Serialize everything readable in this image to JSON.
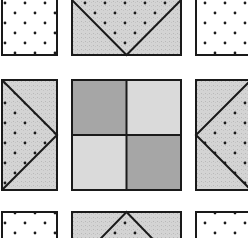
{
  "figure": {
    "colors": {
      "background": "#ffffff",
      "outline": "#1a1a1a",
      "dotted_fabric": "#ffffff",
      "dot": "#1a1a1a",
      "speckled_gray": "#d2d2d2",
      "dark_gray": "#a6a6a6",
      "light_gray": "#dadada"
    },
    "blocks": [
      {
        "id": "corner-top-left",
        "type": "dotted-square"
      },
      {
        "id": "goose-top",
        "type": "flying-geese",
        "point": "down"
      },
      {
        "id": "corner-top-right",
        "type": "dotted-square"
      },
      {
        "id": "goose-left",
        "type": "flying-geese",
        "point": "right"
      },
      {
        "id": "center",
        "type": "four-patch",
        "cells": [
          "dark",
          "light",
          "light",
          "dark"
        ]
      },
      {
        "id": "goose-right",
        "type": "flying-geese",
        "point": "left"
      },
      {
        "id": "corner-bottom-left",
        "type": "dotted-square"
      },
      {
        "id": "goose-bottom",
        "type": "flying-geese",
        "point": "up"
      },
      {
        "id": "corner-bottom-right",
        "type": "dotted-square"
      }
    ]
  }
}
